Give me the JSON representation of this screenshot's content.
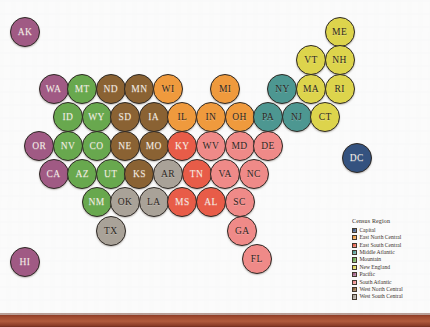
{
  "figure": {
    "name": "us-states-census-region-bubble-map",
    "background_note": "scanned book page with faint bleed-through text",
    "bottom_bar_color": "#a04b31"
  },
  "legend": {
    "title": "Census Region",
    "entries": [
      {
        "label": "Capital",
        "color": "#34527f"
      },
      {
        "label": "East North Central",
        "color": "#ef9a3d"
      },
      {
        "label": "East South Central",
        "color": "#e85c48"
      },
      {
        "label": "Middle Atlantic",
        "color": "#4d9791"
      },
      {
        "label": "Mountain",
        "color": "#67a champion"
      },
      {
        "label": "New England",
        "color": "#ddd44c"
      },
      {
        "label": "Pacific",
        "color": "#a05a84"
      },
      {
        "label": "South Atlantic",
        "color": "#ef8a88"
      },
      {
        "label": "West North Central",
        "color": "#8a6233"
      },
      {
        "label": "West South Central",
        "color": "#a9a298"
      }
    ]
  },
  "colors": {
    "capital": "#34527f",
    "east_north_central": "#ef9a3d",
    "east_south_central": "#e85c48",
    "middle_atlantic": "#4d9791",
    "mountain": "#68a84e",
    "new_england": "#ddd44c",
    "pacific": "#a05a84",
    "south_atlantic": "#ef8a88",
    "west_north_central": "#8a6233",
    "west_south_central": "#a9a298"
  },
  "states": [
    {
      "abbr": "AK",
      "region": "pacific",
      "col": 1,
      "row": 1
    },
    {
      "abbr": "ME",
      "region": "new_england",
      "col": 12,
      "row": 1
    },
    {
      "abbr": "VT",
      "region": "new_england",
      "col": 11,
      "row": 2
    },
    {
      "abbr": "NH",
      "region": "new_england",
      "col": 12,
      "row": 2
    },
    {
      "abbr": "WA",
      "region": "pacific",
      "col": 2,
      "row": 3
    },
    {
      "abbr": "MT",
      "region": "mountain",
      "col": 3,
      "row": 3
    },
    {
      "abbr": "ND",
      "region": "west_north_central",
      "col": 4,
      "row": 3
    },
    {
      "abbr": "MN",
      "region": "west_north_central",
      "col": 5,
      "row": 3
    },
    {
      "abbr": "WI",
      "region": "east_north_central",
      "col": 6,
      "row": 3
    },
    {
      "abbr": "MI",
      "region": "east_north_central",
      "col": 8,
      "row": 3
    },
    {
      "abbr": "NY",
      "region": "middle_atlantic",
      "col": 10,
      "row": 3
    },
    {
      "abbr": "MA",
      "region": "new_england",
      "col": 11,
      "row": 3
    },
    {
      "abbr": "RI",
      "region": "new_england",
      "col": 12,
      "row": 3
    },
    {
      "abbr": "ID",
      "region": "mountain",
      "col": 2.5,
      "row": 4
    },
    {
      "abbr": "WY",
      "region": "mountain",
      "col": 3.5,
      "row": 4
    },
    {
      "abbr": "SD",
      "region": "west_north_central",
      "col": 4.5,
      "row": 4
    },
    {
      "abbr": "IA",
      "region": "west_north_central",
      "col": 5.5,
      "row": 4
    },
    {
      "abbr": "IL",
      "region": "east_north_central",
      "col": 6.5,
      "row": 4
    },
    {
      "abbr": "IN",
      "region": "east_north_central",
      "col": 7.5,
      "row": 4
    },
    {
      "abbr": "OH",
      "region": "east_north_central",
      "col": 8.5,
      "row": 4
    },
    {
      "abbr": "PA",
      "region": "middle_atlantic",
      "col": 9.5,
      "row": 4
    },
    {
      "abbr": "NJ",
      "region": "middle_atlantic",
      "col": 10.5,
      "row": 4
    },
    {
      "abbr": "CT",
      "region": "new_england",
      "col": 11.5,
      "row": 4
    },
    {
      "abbr": "OR",
      "region": "pacific",
      "col": 1.5,
      "row": 5
    },
    {
      "abbr": "NV",
      "region": "mountain",
      "col": 2.5,
      "row": 5
    },
    {
      "abbr": "CO",
      "region": "mountain",
      "col": 3.5,
      "row": 5
    },
    {
      "abbr": "NE",
      "region": "west_north_central",
      "col": 4.5,
      "row": 5
    },
    {
      "abbr": "MO",
      "region": "west_north_central",
      "col": 5.5,
      "row": 5
    },
    {
      "abbr": "KY",
      "region": "east_south_central",
      "col": 6.5,
      "row": 5
    },
    {
      "abbr": "WV",
      "region": "south_atlantic",
      "col": 7.5,
      "row": 5
    },
    {
      "abbr": "MD",
      "region": "south_atlantic",
      "col": 8.5,
      "row": 5
    },
    {
      "abbr": "DE",
      "region": "south_atlantic",
      "col": 9.5,
      "row": 5
    },
    {
      "abbr": "DC",
      "region": "capital",
      "col": 12.6,
      "row": 5.45
    },
    {
      "abbr": "CA",
      "region": "pacific",
      "col": 2,
      "row": 6
    },
    {
      "abbr": "AZ",
      "region": "mountain",
      "col": 3,
      "row": 6
    },
    {
      "abbr": "UT",
      "region": "mountain",
      "col": 4,
      "row": 6
    },
    {
      "abbr": "KS",
      "region": "west_north_central",
      "col": 5,
      "row": 6
    },
    {
      "abbr": "AR",
      "region": "west_south_central",
      "col": 6,
      "row": 6
    },
    {
      "abbr": "TN",
      "region": "east_south_central",
      "col": 7,
      "row": 6
    },
    {
      "abbr": "VA",
      "region": "south_atlantic",
      "col": 8,
      "row": 6
    },
    {
      "abbr": "NC",
      "region": "south_atlantic",
      "col": 9,
      "row": 6
    },
    {
      "abbr": "NM",
      "region": "mountain",
      "col": 3.5,
      "row": 7
    },
    {
      "abbr": "OK",
      "region": "west_south_central",
      "col": 4.5,
      "row": 7
    },
    {
      "abbr": "LA",
      "region": "west_south_central",
      "col": 5.5,
      "row": 7
    },
    {
      "abbr": "MS",
      "region": "east_south_central",
      "col": 6.5,
      "row": 7
    },
    {
      "abbr": "AL",
      "region": "east_south_central",
      "col": 7.5,
      "row": 7
    },
    {
      "abbr": "SC",
      "region": "south_atlantic",
      "col": 8.5,
      "row": 7
    },
    {
      "abbr": "TX",
      "region": "west_south_central",
      "col": 4,
      "row": 8
    },
    {
      "abbr": "GA",
      "region": "south_atlantic",
      "col": 8.6,
      "row": 8
    },
    {
      "abbr": "FL",
      "region": "south_atlantic",
      "col": 9.1,
      "row": 9
    },
    {
      "abbr": "HI",
      "region": "pacific",
      "col": 1,
      "row": 9.1
    }
  ]
}
